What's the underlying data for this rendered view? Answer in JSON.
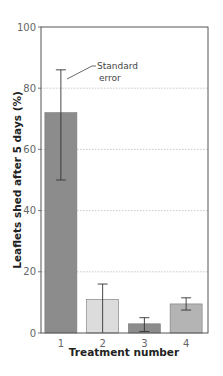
{
  "chart_data": {
    "type": "bar",
    "title": "",
    "xlabel": "Treatment number",
    "ylabel": "Leaflets shed after 5 days (%)",
    "categories": [
      "1",
      "2",
      "3",
      "4"
    ],
    "values": [
      72,
      11,
      3,
      9.5
    ],
    "error_low": [
      50,
      0,
      0.5,
      7.5
    ],
    "error_high": [
      86,
      16,
      5,
      11.5
    ],
    "bar_colors": [
      "#8c8c8c",
      "#dcdcdc",
      "#8c8c8c",
      "#b4b4b4"
    ],
    "ylim": [
      0,
      100
    ],
    "yticks": [
      0,
      20,
      40,
      60,
      80,
      100
    ],
    "grid": "horizontal dotted",
    "annotation": {
      "line1": "Standard",
      "line2": "error"
    }
  }
}
